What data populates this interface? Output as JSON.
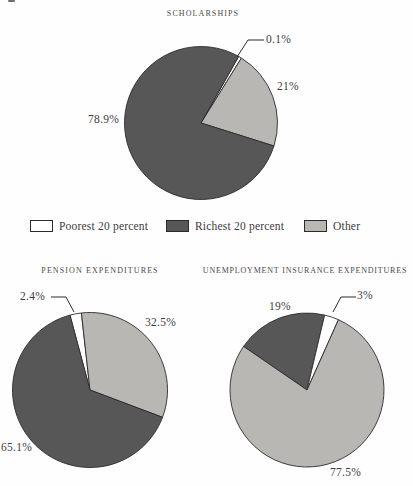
{
  "colors": {
    "poorest": "#ffffff",
    "richest": "#575757",
    "other": "#b8b7b3",
    "outline": "#2b2b2b",
    "text": "#3d3d3d"
  },
  "legend": {
    "items": [
      {
        "label": "Poorest 20 percent",
        "color_key": "poorest"
      },
      {
        "label": "Richest 20 percent",
        "color_key": "richest"
      },
      {
        "label": "Other",
        "color_key": "other"
      }
    ]
  },
  "chart_data": [
    {
      "type": "pie",
      "title": "SCHOLARSHIPS",
      "start_angle_deg": 29.5,
      "slices": [
        {
          "label": "Poorest 20 percent",
          "value": 0.1,
          "display": "0.1%",
          "color_key": "poorest"
        },
        {
          "label": "Other",
          "value": 21,
          "display": "21%",
          "color_key": "other"
        },
        {
          "label": "Richest 20 percent",
          "value": 78.9,
          "display": "78.9%",
          "color_key": "richest"
        }
      ]
    },
    {
      "type": "pie",
      "title": "PENSION EXPENDITURES",
      "start_angle_deg": -15,
      "slices": [
        {
          "label": "Poorest 20 percent",
          "value": 2.4,
          "display": "2.4%",
          "color_key": "poorest"
        },
        {
          "label": "Other",
          "value": 32.5,
          "display": "32.5%",
          "color_key": "other"
        },
        {
          "label": "Richest 20 percent",
          "value": 65.1,
          "display": "65.1%",
          "color_key": "richest"
        }
      ]
    },
    {
      "type": "pie",
      "title": "UNEMPLOYMENT INSURANCE EXPENDITURES",
      "start_angle_deg": -55.5,
      "slices": [
        {
          "label": "Richest 20 percent",
          "value": 19,
          "display": "19%",
          "color_key": "richest"
        },
        {
          "label": "Poorest 20 percent",
          "value": 3,
          "display": "3%",
          "color_key": "poorest"
        },
        {
          "label": "Other",
          "value": 77.5,
          "display": "77.5%",
          "color_key": "other"
        }
      ]
    }
  ]
}
